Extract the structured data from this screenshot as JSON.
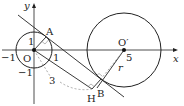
{
  "diagram": {
    "axes": {
      "x_label": "x",
      "y_label": "y"
    },
    "points": {
      "origin": "O",
      "A": "A",
      "B": "B",
      "H": "H",
      "center2": "O′"
    },
    "tick_labels": {
      "x_neg1": "−1",
      "x_pos1": "1",
      "y_pos1": "1",
      "y_neg1": "−1",
      "x_5": "5"
    },
    "segment_labels": {
      "OH_length": "3",
      "radius": "r"
    },
    "colors": {
      "stroke": "#222222",
      "dashed": "#888888"
    }
  }
}
